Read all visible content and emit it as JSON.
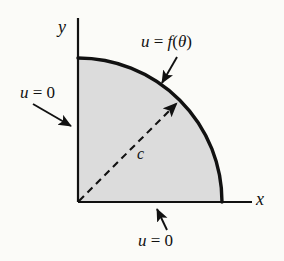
{
  "figure": {
    "background_color": "#fbfbf8",
    "region_fill_color": "#dcdcdc",
    "stroke_color": "#111111"
  },
  "axes": {
    "x_label": "x",
    "y_label": "y",
    "origin": {
      "x": 78,
      "y": 202
    },
    "x_axis_end": {
      "x": 252,
      "y": 202
    },
    "y_axis_top": {
      "x": 78,
      "y": 18
    }
  },
  "region": {
    "shape": "quarter-disk",
    "radius_px": 144,
    "quadrant": "first",
    "fill": "#dcdcdc"
  },
  "labels": {
    "arc_condition": "u = f(θ)",
    "arc_condition_u": "u",
    "arc_condition_eq": " = ",
    "arc_condition_f": "f",
    "arc_condition_arg": "(θ)",
    "left_edge_condition": "u = 0",
    "bottom_edge_condition": "u = 0",
    "radius": "c"
  },
  "annotations": {
    "arrow_to_arc": {
      "from": {
        "x": 176,
        "y": 59
      },
      "to": {
        "x": 162,
        "y": 85
      }
    },
    "arrow_to_left_edge": {
      "from": {
        "x": 34,
        "y": 105
      },
      "to": {
        "x": 72,
        "y": 127
      }
    },
    "arrow_to_bottom_edge": {
      "from": {
        "x": 166,
        "y": 230
      },
      "to": {
        "x": 156,
        "y": 207
      }
    },
    "radius_arrow": {
      "from": {
        "x": 78,
        "y": 202
      },
      "to": {
        "x": 180,
        "y": 100
      },
      "style": "dashed"
    }
  }
}
